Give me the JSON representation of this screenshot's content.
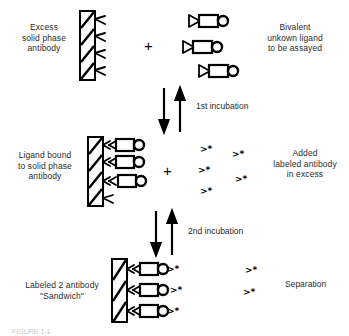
{
  "figure": {
    "type": "two-site sandwich immunoassay schematic",
    "caption_partial": "FIGURE 1-1"
  },
  "rows": {
    "row1": {
      "left_label": "Excess\nsolid phase\nantibody",
      "plus": "+",
      "right_label": "Bivalent\nunkown ligand\nto be assayed",
      "solid_phase_sites": 4,
      "ligand_count": 3
    },
    "row2": {
      "left_label": "Ligand bound\nto solid phase\nantibody",
      "plus": "+",
      "right_label": "Added\nlabeled antibody\nin excess",
      "solid_phase_sites": 4,
      "bound_ligand_count": 3,
      "labeled_antibody_symbol": ">*",
      "labeled_antibody_count": 5
    },
    "row3": {
      "left_label": "Labeled 2 antibody\n\"Sandwich\"",
      "right_label": "Separation",
      "solid_phase_sites": 3,
      "sandwich_count": 3,
      "free_labeled_symbol": ">*",
      "free_labeled_count": 2
    }
  },
  "arrows": {
    "first": {
      "label": "1st incubation",
      "down_arrow": "down-arrow",
      "up_arrow": "up-arrow"
    },
    "second": {
      "label": "2nd incubation",
      "down_arrow": "down-arrow",
      "up_arrow": "up-arrow"
    }
  },
  "colors": {
    "ink": "#000000",
    "text": "#2b2b2b",
    "paper": "#ffffff"
  }
}
